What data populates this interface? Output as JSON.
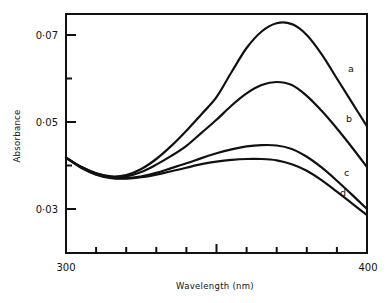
{
  "chart_data": {
    "type": "line",
    "title": "",
    "xlabel": "Wavelength (nm)",
    "ylabel": "Absorbance",
    "xlim": [
      300,
      400
    ],
    "ylim": [
      0.025,
      0.0745
    ],
    "x_ticks": [
      300,
      400
    ],
    "x_minor_ticks": [
      310,
      320,
      330,
      340,
      350,
      360,
      370,
      380,
      390
    ],
    "y_ticks": [
      0.03,
      0.05,
      0.07
    ],
    "y_tick_labels": [
      "0·03",
      "0·05",
      "0·07"
    ],
    "y_minor_ticks": [
      0.04,
      0.06
    ],
    "grid": false,
    "legend": "inline labels at right end of curves",
    "x": [
      300,
      305,
      310,
      315,
      320,
      325,
      330,
      335,
      340,
      345,
      350,
      355,
      360,
      365,
      370,
      375,
      380,
      385,
      390,
      395,
      400
    ],
    "series": [
      {
        "name": "a",
        "values": [
          0.0418,
          0.0397,
          0.0382,
          0.0375,
          0.0378,
          0.0392,
          0.0415,
          0.0445,
          0.048,
          0.0518,
          0.0557,
          0.0615,
          0.067,
          0.0708,
          0.0727,
          0.0725,
          0.07,
          0.0655,
          0.06,
          0.0545,
          0.049
        ]
      },
      {
        "name": "b",
        "values": [
          0.0418,
          0.0397,
          0.0382,
          0.0374,
          0.0375,
          0.0385,
          0.0402,
          0.0422,
          0.0445,
          0.0475,
          0.0505,
          0.0538,
          0.0566,
          0.0585,
          0.0592,
          0.0585,
          0.056,
          0.0525,
          0.0485,
          0.0442,
          0.0396
        ]
      },
      {
        "name": "c",
        "values": [
          0.0418,
          0.0396,
          0.038,
          0.0372,
          0.0371,
          0.0375,
          0.0383,
          0.0394,
          0.0405,
          0.0417,
          0.0428,
          0.0437,
          0.0444,
          0.0447,
          0.0446,
          0.0438,
          0.042,
          0.0395,
          0.0365,
          0.0333,
          0.03
        ]
      },
      {
        "name": "d",
        "values": [
          0.0418,
          0.0395,
          0.0379,
          0.0371,
          0.037,
          0.0373,
          0.0379,
          0.0387,
          0.0395,
          0.0403,
          0.0409,
          0.0413,
          0.0415,
          0.0415,
          0.0412,
          0.0403,
          0.0388,
          0.0366,
          0.034,
          0.0313,
          0.0286
        ]
      }
    ],
    "labels": {
      "x_min": "300",
      "x_max": "400"
    }
  },
  "style": {
    "ink": "#111111",
    "background": "#ffffff"
  }
}
